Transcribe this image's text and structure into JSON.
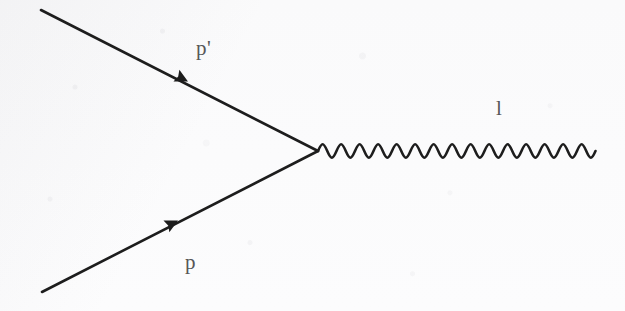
{
  "figure": {
    "kind": "feynman-diagram",
    "background_color": "#fbfbfb",
    "stroke_color": "#1d1d1d",
    "label_color": "#575757",
    "width": 625,
    "height": 311,
    "vertex": {
      "x": 318,
      "y": 151
    }
  },
  "labels": {
    "incoming_fermion": "p",
    "outgoing_fermion": "p'",
    "boson": "l"
  },
  "lines": {
    "outgoing_fermion": {
      "name": "outgoing-fermion-line",
      "from": {
        "x": 41,
        "y": 10
      },
      "to": {
        "x": 318,
        "y": 151
      },
      "arrow_at": {
        "x": 185,
        "y": 80
      },
      "arrow_direction": "toward-vertex",
      "stroke_width": 2.6
    },
    "incoming_fermion": {
      "name": "incoming-fermion-line",
      "from": {
        "x": 42,
        "y": 292
      },
      "to": {
        "x": 318,
        "y": 151
      },
      "arrow_at": {
        "x": 175,
        "y": 222
      },
      "arrow_direction": "toward-vertex",
      "stroke_width": 2.6
    },
    "boson": {
      "name": "boson-wavy-line",
      "from": {
        "x": 318,
        "y": 151
      },
      "to": {
        "x": 596,
        "y": 151
      },
      "cycles": 15,
      "period": 18.5,
      "amplitude": 9,
      "stroke_width": 2.6
    }
  }
}
